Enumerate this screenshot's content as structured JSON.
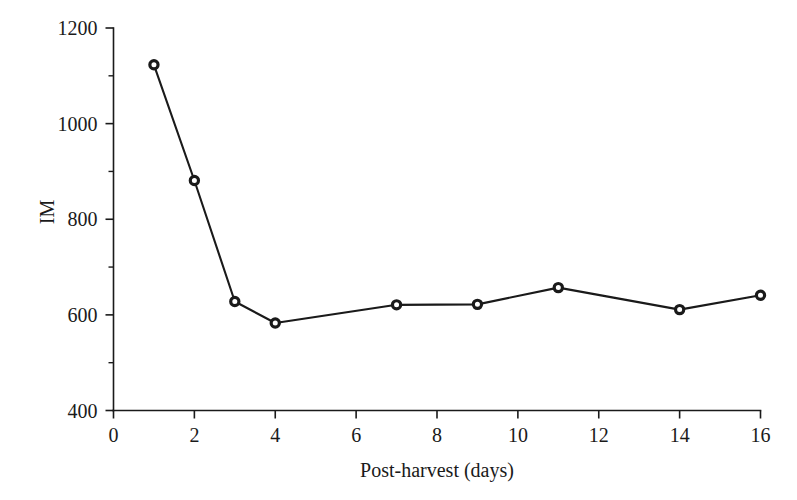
{
  "chart_data": {
    "type": "line",
    "title": "",
    "subtitle": "",
    "xlabel": "Post-harvest (days)",
    "ylabel": "IM",
    "xlim": [
      0,
      16
    ],
    "ylim": [
      400,
      1200
    ],
    "xticks": [
      0,
      2,
      4,
      6,
      8,
      10,
      12,
      14,
      16
    ],
    "xtick_labels": [
      "0",
      "2",
      "4",
      "6",
      "8",
      "10",
      "12",
      "14",
      "16"
    ],
    "yticks": [
      400,
      600,
      800,
      1000,
      1200
    ],
    "ytick_labels": [
      "400",
      "600",
      "800",
      "1000",
      "1200"
    ],
    "y_minor_ticks": [
      500,
      700,
      900,
      1100
    ],
    "grid": false,
    "legend": null,
    "legend_position": "none",
    "marker": "open-circle",
    "line_color": "#1a1a1a",
    "marker_face_color": "#ffffff",
    "marker_edge_color": "#1a1a1a",
    "x": [
      1,
      2,
      3,
      4,
      7,
      9,
      11,
      14,
      16
    ],
    "values": [
      1123,
      881,
      628,
      583,
      621,
      622,
      657,
      611,
      641
    ],
    "series": [
      {
        "name": "IM",
        "x": [
          1,
          2,
          3,
          4,
          7,
          9,
          11,
          14,
          16
        ],
        "values": [
          1123,
          881,
          628,
          583,
          621,
          622,
          657,
          611,
          641
        ]
      }
    ],
    "annotations": []
  },
  "axes": {
    "x_axis_name": "Post-harvest (days)",
    "y_axis_name": "IM"
  }
}
